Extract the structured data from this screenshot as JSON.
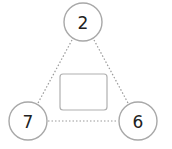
{
  "diagram": {
    "type": "number-triangle",
    "nodes": [
      {
        "id": "top",
        "label": "2",
        "cx": 83,
        "cy": 22
      },
      {
        "id": "left",
        "label": "7",
        "cx": 28,
        "cy": 121
      },
      {
        "id": "right",
        "label": "6",
        "cx": 138,
        "cy": 121
      }
    ],
    "center_box": {
      "value": ""
    },
    "colors": {
      "stroke": "#a8a8a8",
      "edge": "#9a9a9a",
      "text": "#222222"
    }
  }
}
